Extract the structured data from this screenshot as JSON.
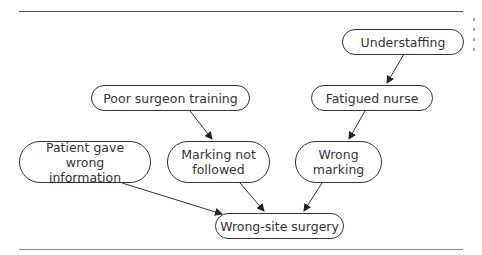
{
  "diagram": {
    "type": "causal-flow",
    "nodes": [
      {
        "id": "understaffing",
        "label": "Understaffing"
      },
      {
        "id": "fatigued_nurse",
        "label": "Fatigued nurse"
      },
      {
        "id": "poor_training",
        "label": "Poor surgeon training"
      },
      {
        "id": "patient_wrong_info",
        "label": "Patient gave wrong information"
      },
      {
        "id": "marking_not_followed",
        "label": "Marking not followed"
      },
      {
        "id": "wrong_marking",
        "label": "Wrong marking"
      },
      {
        "id": "wrong_site_surgery",
        "label": "Wrong-site surgery"
      }
    ],
    "edges": [
      {
        "from": "understaffing",
        "to": "fatigued_nurse"
      },
      {
        "from": "fatigued_nurse",
        "to": "wrong_marking"
      },
      {
        "from": "poor_training",
        "to": "marking_not_followed"
      },
      {
        "from": "patient_wrong_info",
        "to": "wrong_site_surgery"
      },
      {
        "from": "marking_not_followed",
        "to": "wrong_site_surgery"
      },
      {
        "from": "wrong_marking",
        "to": "wrong_site_surgery"
      }
    ],
    "colors": {
      "stroke": "#333333",
      "rule": "#555555",
      "background": "#ffffff"
    }
  }
}
